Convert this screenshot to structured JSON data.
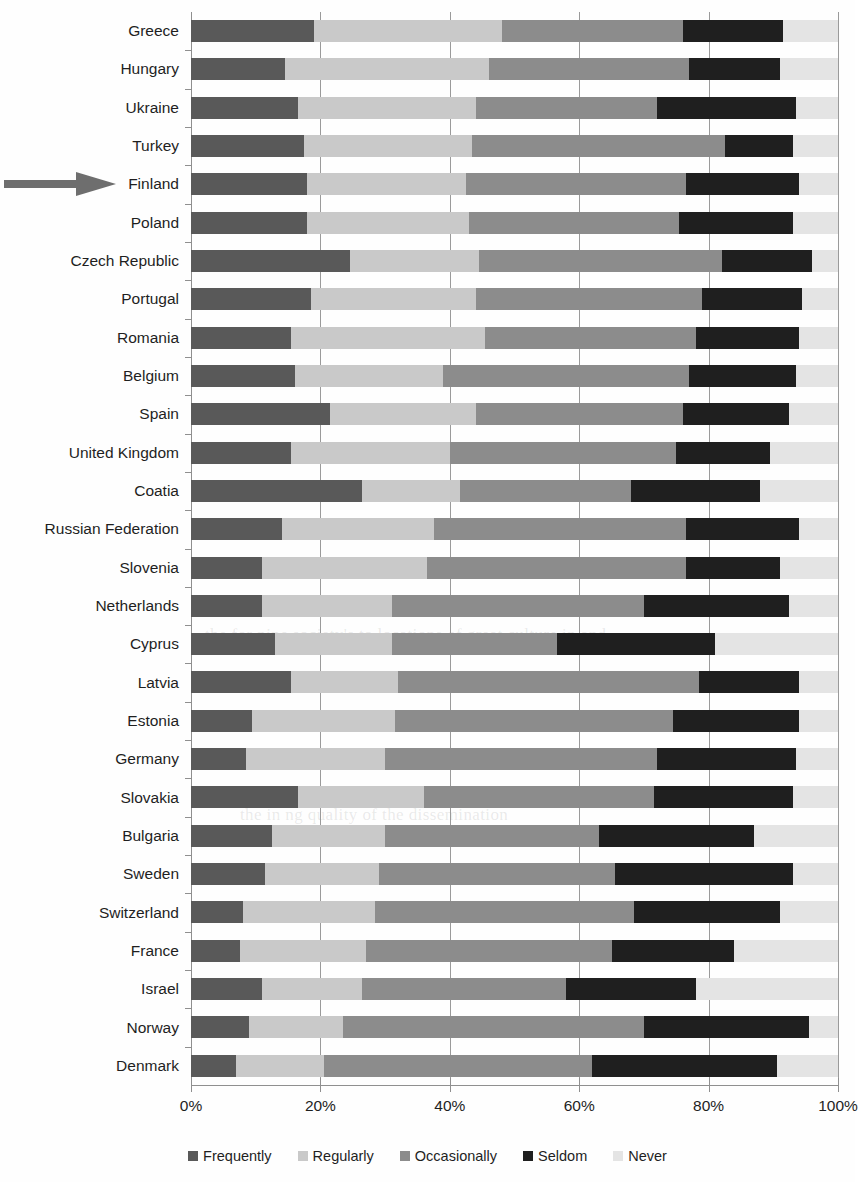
{
  "chart_data": {
    "type": "bar",
    "subtype": "stacked-horizontal-100pct",
    "title": "",
    "xlabel": "",
    "ylabel": "",
    "xlim": [
      0,
      100
    ],
    "xticks": [
      "0%",
      "20%",
      "40%",
      "60%",
      "80%",
      "100%"
    ],
    "xtick_values": [
      0,
      20,
      40,
      60,
      80,
      100
    ],
    "grid": true,
    "legend_position": "bottom",
    "orientation": "horizontal",
    "categories": [
      "Greece",
      "Hungary",
      "Ukraine",
      "Turkey",
      "Finland",
      "Poland",
      "Czech Republic",
      "Portugal",
      "Romania",
      "Belgium",
      "Spain",
      "United Kingdom",
      "Coatia",
      "Russian Federation",
      "Slovenia",
      "Netherlands",
      "Cyprus",
      "Latvia",
      "Estonia",
      "Germany",
      "Slovakia",
      "Bulgaria",
      "Sweden",
      "Switzerland",
      "France",
      "Israel",
      "Norway",
      "Denmark"
    ],
    "series": [
      {
        "name": "Frequently",
        "color": "#595959",
        "values": [
          19,
          14.5,
          16.5,
          17.5,
          18,
          18,
          24.5,
          18.5,
          15.5,
          16,
          21.5,
          15.5,
          26.5,
          14,
          11,
          11,
          13,
          15.5,
          9.5,
          8.5,
          16.5,
          12.5,
          11.5,
          8,
          7.5,
          11,
          9,
          7
        ]
      },
      {
        "name": "Regularly",
        "color": "#c9c9c9",
        "values": [
          29,
          31.5,
          27.5,
          26,
          24.5,
          25,
          20,
          25.5,
          30,
          23,
          22.5,
          24.5,
          15,
          23.5,
          25.5,
          20,
          18,
          16.5,
          22,
          21.5,
          19.5,
          17.5,
          17.5,
          20.5,
          19.5,
          15.5,
          14.5,
          13.5
        ]
      },
      {
        "name": "Occasionally",
        "color": "#8c8c8c",
        "values": [
          28,
          31,
          28,
          39,
          34,
          32.5,
          37.5,
          35,
          32.5,
          38,
          32,
          35,
          26.5,
          39,
          40,
          39,
          25.5,
          46.5,
          43,
          42,
          35.5,
          33,
          36.5,
          40,
          38,
          31.5,
          46.5,
          41.5
        ]
      },
      {
        "name": "Seldom",
        "color": "#1f1f1f",
        "values": [
          15.5,
          14,
          21.5,
          10.5,
          17.5,
          17.5,
          14,
          15.5,
          16,
          16.5,
          16.5,
          14.5,
          20,
          17.5,
          14.5,
          22.5,
          24.5,
          15.5,
          19.5,
          21.5,
          21.5,
          24,
          27.5,
          22.5,
          19,
          20,
          25.5,
          28.5
        ]
      },
      {
        "name": "Never",
        "color": "#e4e4e4",
        "values": [
          8.5,
          9,
          6.5,
          7,
          6,
          7,
          4,
          5.5,
          6,
          6.5,
          7.5,
          10.5,
          12,
          6,
          9,
          7.5,
          19,
          6,
          6,
          6.5,
          7,
          13,
          7,
          9,
          16,
          22,
          4.5,
          9.5
        ]
      }
    ]
  },
  "annotations": {
    "pointer": {
      "name": "arrow-pointer",
      "target_category": "Finland",
      "color": "#6e6e6e"
    }
  },
  "legend": {
    "items": [
      {
        "label": "Frequently",
        "color": "#595959"
      },
      {
        "label": "Regularly",
        "color": "#c9c9c9"
      },
      {
        "label": "Occasionally",
        "color": "#8c8c8c"
      },
      {
        "label": "Seldom",
        "color": "#1f1f1f"
      },
      {
        "label": "Never",
        "color": "#e4e4e4"
      }
    ]
  },
  "background_text": [
    "the for nine society's to locations of great culture in and",
    "the in ng quality of the dissemination"
  ]
}
